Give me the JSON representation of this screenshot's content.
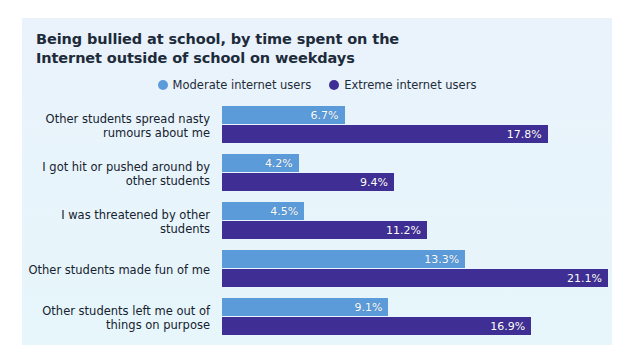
{
  "chart_data": {
    "type": "bar",
    "orientation": "horizontal",
    "title": "Being bullied at school, by time spent on the Internet outside of school on weekdays",
    "title_lines": [
      "Being bullied at school, by time spent on the",
      "Internet outside of school on weekdays"
    ],
    "xlabel": "",
    "ylabel": "",
    "xlim": [
      0,
      21.1
    ],
    "grid": false,
    "legend_position": "top-center",
    "value_suffix": "%",
    "categories": [
      "Other students spread nasty rumours about me",
      "I got hit or pushed around by other students",
      "I was threatened by other students",
      "Other students made fun of me",
      "Other students left me out of things on purpose"
    ],
    "category_lines": [
      [
        "Other students spread nasty",
        "rumours about me"
      ],
      [
        "I got hit or pushed around by",
        "other students"
      ],
      [
        "I was threatened by other",
        "students"
      ],
      [
        "Other students made fun of me"
      ],
      [
        "Other students left me out of",
        "things on purpose"
      ]
    ],
    "series": [
      {
        "name": "Moderate internet users",
        "color": "#5b9bd9",
        "values": [
          6.7,
          4.2,
          4.5,
          13.3,
          9.1
        ],
        "labels": [
          "6.7%",
          "4.2%",
          "4.5%",
          "13.3%",
          "9.1%"
        ]
      },
      {
        "name": "Extreme internet users",
        "color": "#3f2f94",
        "values": [
          17.8,
          9.4,
          11.2,
          21.1,
          16.9
        ],
        "labels": [
          "17.8%",
          "9.4%",
          "11.2%",
          "21.1%",
          "16.9%"
        ]
      }
    ]
  },
  "colors": {
    "panel_background": "#e8f2fb",
    "page_background": "#ffffff",
    "title_text": "#1d2b3a",
    "label_text": "#16222f",
    "moderate": "#5b9bd9",
    "extreme": "#3f2f94",
    "value_text": "#ffffff"
  }
}
